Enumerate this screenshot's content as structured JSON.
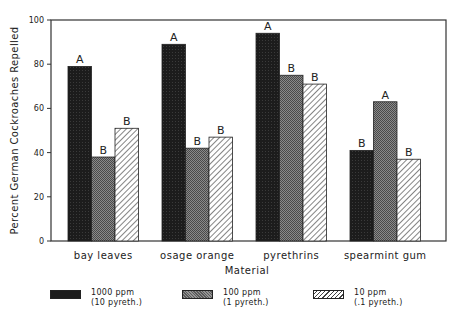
{
  "chart_data": {
    "type": "bar",
    "title": "",
    "xlabel": "Material",
    "ylabel": "Percent German Cockroaches Repelled",
    "ylim": [
      0,
      100
    ],
    "yticks": [
      0,
      20,
      40,
      60,
      80,
      100
    ],
    "grid": false,
    "legend_position": "bottom",
    "categories": [
      "bay leaves",
      "osage orange",
      "pyrethrins",
      "spearmint gum"
    ],
    "series": [
      {
        "name": "1000 ppm (10 pyreth.)",
        "label_line1": "1000 ppm",
        "label_line2": "(10 pyreth.)",
        "pattern": "solid-dark",
        "color": "#1c1c1c",
        "values": [
          79,
          89,
          94,
          41
        ],
        "annotations": [
          "A",
          "A",
          "A",
          "B"
        ]
      },
      {
        "name": "100 ppm (1 pyreth.)",
        "label_line1": "100 ppm",
        "label_line2": "(1 pyreth.)",
        "pattern": "dense-crosshatch-gray",
        "color": "#6e6e6e",
        "values": [
          38,
          42,
          75,
          63
        ],
        "annotations": [
          "B",
          "B",
          "B",
          "A"
        ]
      },
      {
        "name": "10 ppm (.1 pyreth.)",
        "label_line1": "10 ppm",
        "label_line2": "(.1 pyreth.)",
        "pattern": "diagonal-hatch",
        "color": "#ffffff",
        "values": [
          51,
          47,
          71,
          37
        ],
        "annotations": [
          "B",
          "B",
          "B",
          "B"
        ]
      }
    ]
  }
}
